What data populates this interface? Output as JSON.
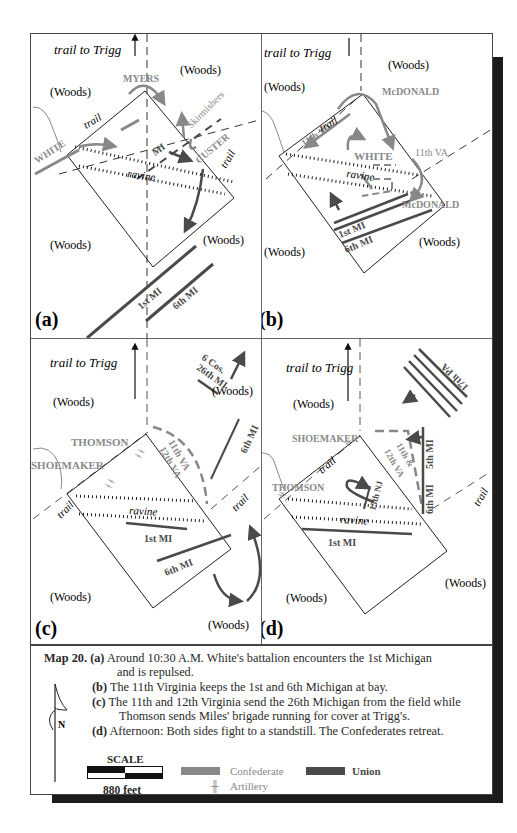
{
  "colors": {
    "confederate": "#888888",
    "union": "#4a4a4a",
    "outline": "#222222",
    "text_gray": "#8a8a8a"
  },
  "panels": {
    "a": {
      "letter": "(a)",
      "trail_to_trigg": "trail to Trigg",
      "woods": [
        "(Woods)",
        "(Woods)",
        "(Woods)",
        "(Woods)"
      ],
      "ravine": "ravine",
      "trails": [
        "trail",
        "trail"
      ],
      "confederate_labels": [
        "MYERS",
        "Skirmishers",
        "CUSTER",
        "WHITE"
      ],
      "union_labels": [
        "MI",
        "1st MI",
        "6th MI"
      ]
    },
    "b": {
      "letter": "(b)",
      "trail_to_trigg": "trail to Trigg",
      "woods": [
        "(Woods)",
        "(Woods)",
        "(Woods)",
        "(Woods)"
      ],
      "ravine": "ravine",
      "trails": [
        "trail"
      ],
      "confederate_labels": [
        "McDONALD",
        "11th VA",
        "WHITE",
        "11th VA",
        "McDONALD"
      ],
      "union_labels": [
        "1st MI",
        "6th MI"
      ]
    },
    "c": {
      "letter": "(c)",
      "trail_to_trigg": "trail to Trigg",
      "woods": [
        "(Woods)",
        "(Woods)",
        "(Woods)",
        "(Woods)"
      ],
      "ravine": "ravine",
      "trails": [
        "trail",
        "trail"
      ],
      "confederate_labels": [
        "THOMSON",
        "SHOEMAKER",
        "11th VA",
        "12th VA"
      ],
      "union_labels": [
        "6 Cos.",
        "26th MI",
        "6th MI",
        "1st MI",
        "6th MI"
      ]
    },
    "d": {
      "letter": "(d)",
      "trail_to_trigg": "trail to Trigg",
      "woods": [
        "(Woods)",
        "(Woods)",
        "(Woods)"
      ],
      "ravine": "ravine",
      "trails": [
        "trail",
        "trail"
      ],
      "confederate_labels": [
        "SHOEMAKER",
        "THOMSON",
        "11th &",
        "12th VA"
      ],
      "union_labels": [
        "17th PA",
        "5th MI",
        "6th MI",
        "15th NJ",
        "1st MI"
      ]
    }
  },
  "caption": {
    "map_label": "Map 20.",
    "items": [
      {
        "letter": "(a)",
        "text": "Around 10:30 A.M. White's battalion encounters the 1st Michigan",
        "cont": "and is repulsed."
      },
      {
        "letter": "(b)",
        "text": "The 11th Virginia keeps the 1st and 6th Michigan at bay."
      },
      {
        "letter": "(c)",
        "text": "The 11th and 12th Virginia send the 26th Michigan from the field while",
        "cont": "Thomson sends Miles' brigade running for cover at Trigg's."
      },
      {
        "letter": "(d)",
        "text": "Afternoon:  Both sides fight to a standstill. The Confederates retreat."
      }
    ],
    "north_label": "N",
    "scale": {
      "title": "SCALE",
      "distance": "880 feet"
    },
    "legend": {
      "confederate": "Confederate",
      "union": "Union",
      "artillery": "Artillery",
      "artillery_icon": "╫"
    }
  }
}
